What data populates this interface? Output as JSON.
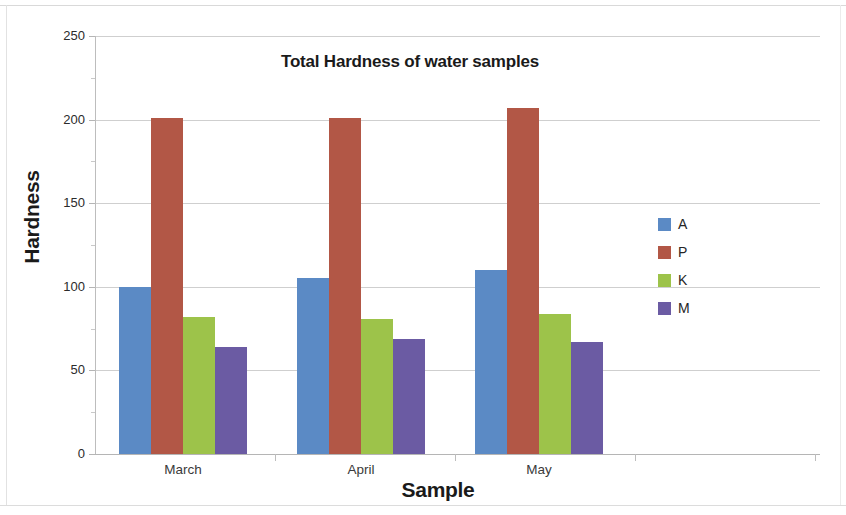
{
  "chart_data": {
    "type": "bar",
    "title": "Total Hardness of water samples",
    "xlabel": "Sample",
    "ylabel": "Hardness",
    "categories": [
      "March",
      "April",
      "May"
    ],
    "series": [
      {
        "name": "A",
        "color": "#5b8ac5",
        "values": [
          100,
          105,
          110
        ]
      },
      {
        "name": "P",
        "color": "#b25746",
        "values": [
          201,
          201,
          207
        ]
      },
      {
        "name": "K",
        "color": "#9dc34a",
        "values": [
          82,
          81,
          84
        ]
      },
      {
        "name": "M",
        "color": "#6b5ba3",
        "values": [
          64,
          69,
          67
        ]
      }
    ],
    "ylim": [
      0,
      250
    ],
    "yticks": [
      0,
      50,
      100,
      150,
      200,
      250
    ],
    "ytick_labels": [
      "0",
      "50",
      "100",
      "150",
      "200",
      "250"
    ],
    "grid": true,
    "legend_position": "right",
    "legend_entries": [
      "A",
      "P",
      "K",
      "M"
    ]
  }
}
